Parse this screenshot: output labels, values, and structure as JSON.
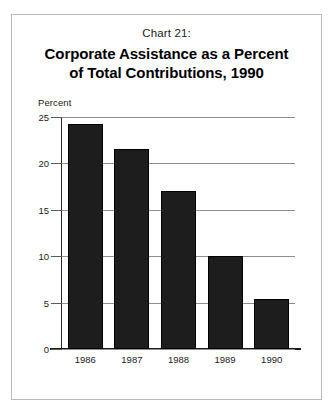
{
  "figure": {
    "number_label": "Chart 21:",
    "title_line1": "Corporate Assistance as a Percent",
    "title_line2": "of Total Contributions, 1990",
    "axis_label": "Percent"
  },
  "chart_data": {
    "type": "bar",
    "title": "Chart 21: Corporate Assistance as a Percent of Total Contributions, 1990",
    "xlabel": "",
    "ylabel": "Percent",
    "categories": [
      "1986",
      "1987",
      "1988",
      "1989",
      "1990"
    ],
    "values": [
      24.2,
      21.5,
      17.0,
      10.0,
      5.4
    ],
    "ylim": [
      0,
      25
    ],
    "yticks": [
      0,
      5,
      10,
      15,
      20,
      25
    ],
    "ytick_labels": [
      "0",
      "5",
      "10",
      "15",
      "20",
      "25"
    ],
    "grid": true,
    "legend": false,
    "bar_color": "#1d1d1d",
    "gridline_color": "#8d8d8d",
    "axis_color": "#1a1a1a"
  }
}
